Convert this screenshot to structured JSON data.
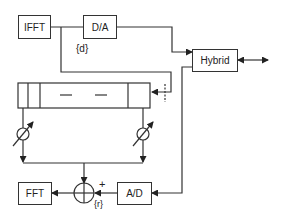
{
  "diagram": {
    "blocks": {
      "ifft": "IFFT",
      "da": "D/A",
      "hybrid": "Hybrid",
      "fft": "FFT",
      "ad": "A/D"
    },
    "labels": {
      "d": "{d}",
      "r": "{r}",
      "plus": "+"
    },
    "colors": {
      "line": "#333333",
      "background": "#ffffff"
    }
  }
}
